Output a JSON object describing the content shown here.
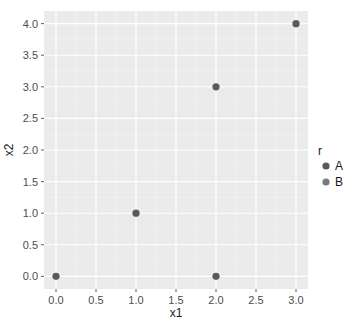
{
  "chart_data": {
    "type": "scatter",
    "title": "",
    "xlabel": "x1",
    "ylabel": "x2",
    "xlim": [
      -0.15,
      3.15
    ],
    "ylim": [
      -0.2,
      4.2
    ],
    "x_ticks": [
      "0.0",
      "0.5",
      "1.0",
      "1.5",
      "2.0",
      "2.5",
      "3.0"
    ],
    "y_ticks": [
      "0.0",
      "0.5",
      "1.0",
      "1.5",
      "2.0",
      "2.5",
      "3.0",
      "3.5",
      "4.0"
    ],
    "grid": true,
    "legend_position": "right",
    "legend": {
      "title": "r",
      "entries": [
        {
          "label": "A",
          "color": "#5a5a5a"
        },
        {
          "label": "B",
          "color": "#7a7a7a"
        }
      ]
    },
    "points": [
      {
        "x": 0,
        "y": 0
      },
      {
        "x": 1,
        "y": 1
      },
      {
        "x": 2,
        "y": 0
      },
      {
        "x": 2,
        "y": 3
      },
      {
        "x": 3,
        "y": 4
      }
    ],
    "colors": {
      "panel_bg": "#ebebeb",
      "grid_major": "#ffffff",
      "grid_minor": "#f5f5f5",
      "point": "#5a5a5a"
    }
  }
}
